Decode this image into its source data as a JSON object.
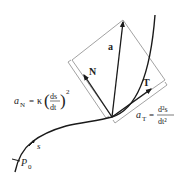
{
  "diagram": {
    "colors": {
      "curve": "#1a1a1a",
      "vector": "#1a1a1a",
      "frame": "#8a8a8a",
      "text": "#222222",
      "background": "#ffffff"
    },
    "labels": {
      "acceleration_vector": "a",
      "normal_vector": "N",
      "tangent_vector": "T",
      "arc_length": "s",
      "start_point": "P",
      "start_point_sub": "0",
      "normal_component": {
        "lhs": "a",
        "lhs_sub": "N",
        "equals": "=",
        "kappa": "κ",
        "paren_open": "(",
        "paren_close": ")",
        "numerator": "ds",
        "denominator": "dt",
        "exponent": "2"
      },
      "tangential_component": {
        "lhs": "a",
        "lhs_sub": "T",
        "equals": "=",
        "numerator": "d²s",
        "denominator": "dt²"
      }
    }
  }
}
